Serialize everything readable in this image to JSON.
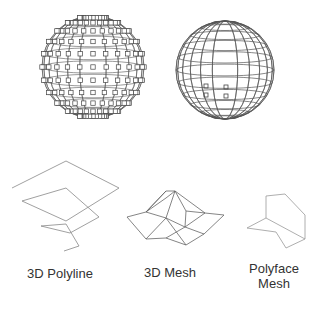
{
  "figure": {
    "type": "autocad-3d-object-types",
    "objects": [
      {
        "id": "sphere-grips",
        "description": "wireframe sphere with grip squares at every vertex"
      },
      {
        "id": "sphere-mesh",
        "description": "wireframe sphere with few grip squares"
      },
      {
        "id": "polyline",
        "label": "3D Polyline"
      },
      {
        "id": "mesh",
        "label": "3D Mesh"
      },
      {
        "id": "polyface",
        "label_line1": "Polyface",
        "label_line2": "Mesh"
      }
    ]
  },
  "labels": {
    "polyline": "3D Polyline",
    "mesh": "3D Mesh",
    "polyface_line1": "Polyface",
    "polyface_line2": "Mesh"
  },
  "colors": {
    "line": "#555555",
    "light_line": "#999999",
    "text": "#333333"
  }
}
